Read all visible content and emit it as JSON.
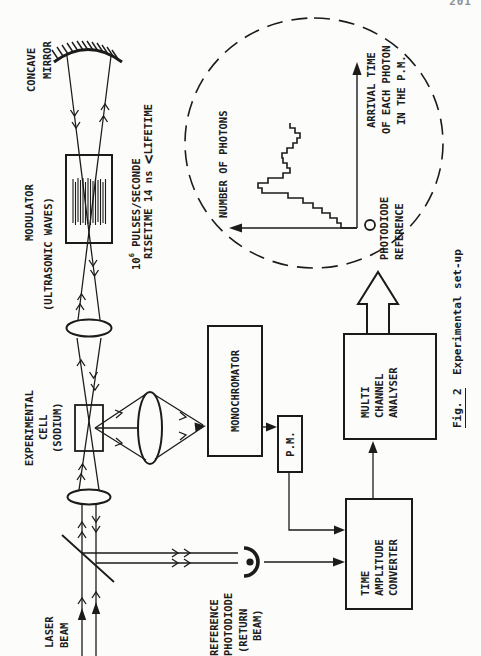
{
  "page": {
    "number": "201"
  },
  "labels": {
    "laser_beam": [
      "LASER",
      "BEAM"
    ],
    "reference_photodiode": [
      "REFERENCE",
      "PHOTODIODE",
      "(RETURN",
      "BEAM)"
    ],
    "experimental_cell": [
      "EXPERIMENTAL",
      "CELL",
      "(SODIUM)"
    ],
    "modulator": [
      "MODULATOR",
      "(ULTRASONIC WAVES)"
    ],
    "concave_mirror": [
      "CONCAVE",
      "MIRROR"
    ],
    "pulse_spec": {
      "base": "10",
      "sup": "6",
      "rest": " PULSES/SECONDE",
      "line2_pre": "RISETIME 14 ns ",
      "lt": "<",
      "line2_post": "LIFETIME"
    }
  },
  "boxes": {
    "monochromator": "MONOCHROMATOR",
    "pm": "P.M.",
    "time_amplitude_converter": [
      "TIME",
      "AMPLITUDE",
      "CONVERTER"
    ],
    "multi_channel_analyser": [
      "MULTI",
      "CHANNEL",
      "ANALYSER"
    ]
  },
  "inset": {
    "y_axis_label": "NUMBER OF PHOTONS",
    "x_axis_label": [
      "ARRIVAL TIME",
      "OF EACH PHOTON",
      "IN THE P.M."
    ],
    "marker_label": [
      "PHOTODIODE",
      "REFERENCE"
    ]
  },
  "caption": {
    "fig": "Fig. 2",
    "rest": "  Experimental set-up"
  },
  "chart_data": {
    "type": "bar",
    "xlabel": "ARRIVAL TIME OF EACH PHOTON IN THE P.M.",
    "ylabel": "NUMBER OF PHOTONS",
    "units": "relative (no numeric ticks shown)",
    "x_bin_index": [
      1,
      2,
      3,
      4,
      5,
      6,
      7,
      8,
      9,
      10,
      11,
      12,
      13,
      14,
      15,
      16,
      17,
      18,
      19,
      20,
      21
    ],
    "values": [
      16,
      20,
      27,
      35,
      44,
      54,
      69,
      95,
      99,
      89,
      74,
      67,
      70,
      74,
      75,
      70,
      64,
      60,
      57,
      62,
      67
    ],
    "annotations": [
      "circle marker at origin = photodiode reference pulse"
    ],
    "legend": [],
    "grid": false
  }
}
